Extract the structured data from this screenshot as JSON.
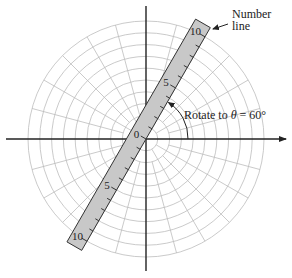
{
  "diagram": {
    "type": "polar-grid-with-rotated-number-line",
    "annotations": {
      "number_line_label_line1": "Number",
      "number_line_label_line2": "line",
      "rotate_prefix": "Rotate to ",
      "rotate_theta": "θ",
      "rotate_suffix": " = 60°"
    },
    "number_line": {
      "angle_degrees": 60,
      "labels": [
        "0",
        "5",
        "10",
        "5",
        "10"
      ],
      "label_values": [
        0,
        5,
        10,
        -5,
        -10
      ],
      "range": [
        -10,
        10
      ],
      "tick_step": 1
    },
    "polar_grid": {
      "circle_count": 10,
      "radial_line_step_degrees": 15
    },
    "colors": {
      "axis": "#222222",
      "grid": "#bdbdbd",
      "strip_fill": "#c8c8c8",
      "strip_stroke": "#333333"
    }
  }
}
